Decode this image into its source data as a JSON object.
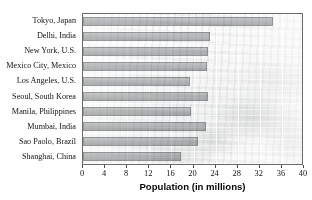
{
  "chart_data": {
    "type": "bar",
    "orientation": "horizontal",
    "title": "",
    "xlabel": "Population (in millions)",
    "ylabel": "",
    "xlim": [
      0,
      40
    ],
    "xticks": [
      0,
      4,
      8,
      12,
      16,
      20,
      24,
      28,
      32,
      36,
      40
    ],
    "xtick_labels": [
      "0",
      "4",
      "8",
      "12",
      "16",
      "20",
      "24",
      "28",
      "32",
      "36",
      "40"
    ],
    "grid": "vertical",
    "legend": "none",
    "categories": [
      "Tokyo, Japan",
      "Delhi, India",
      "New York, U.S.",
      "Mexico City, Mexico",
      "Los Angeles, U.S.",
      "Seoul, South Korea",
      "Manila, Philippines",
      "Mumbai, India",
      "Sao Paolo, Brazil",
      "Shanghai, China"
    ],
    "values": [
      34.4,
      23.0,
      22.6,
      22.4,
      19.4,
      22.6,
      19.6,
      22.2,
      20.9,
      17.7
    ],
    "bar_color": "#b4b7b8",
    "bar_edge_color": "#8e9192",
    "plot_background": "faded-cityscape-photo"
  },
  "axis": {
    "x_title": "Population (in millions)"
  }
}
